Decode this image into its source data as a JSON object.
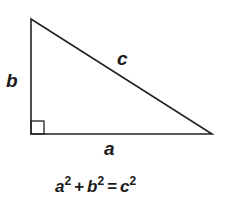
{
  "diagram": {
    "stroke_color": "#222222",
    "text_color": "#1a1a1a",
    "vertices": {
      "top": [
        31,
        19
      ],
      "bottom_left": [
        31,
        134
      ],
      "bottom_right": [
        212,
        134
      ]
    },
    "right_angle_marker": true,
    "labels": {
      "vertical_leg": "b",
      "hypotenuse": "c",
      "horizontal_leg": "a"
    },
    "equation": {
      "a": "a",
      "b": "b",
      "c": "c",
      "exp": "2",
      "plus": "+",
      "equals": "="
    }
  }
}
